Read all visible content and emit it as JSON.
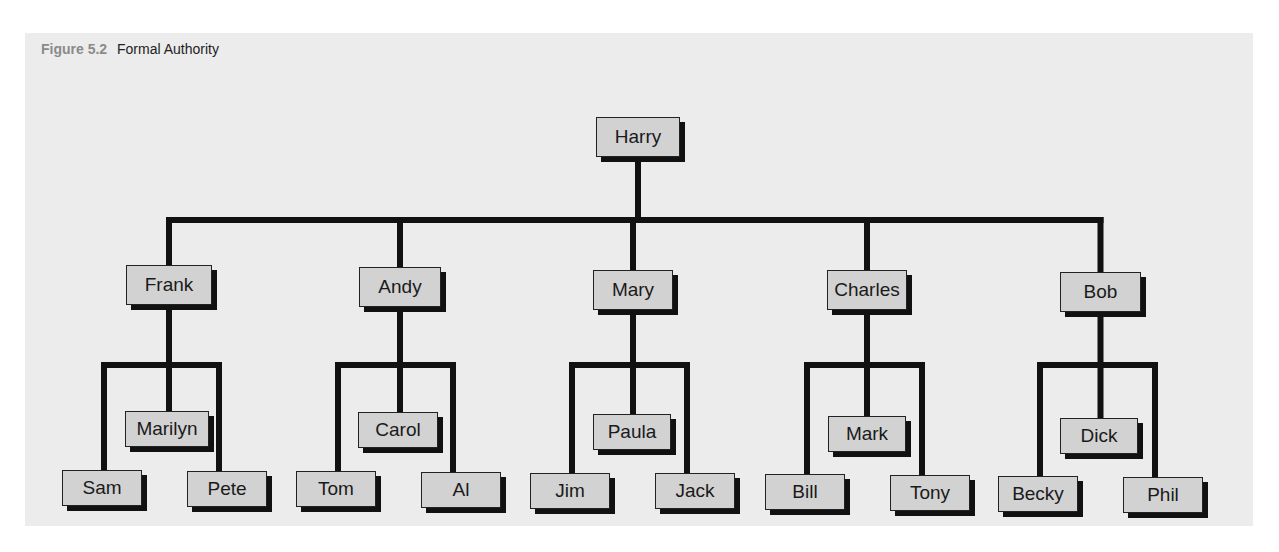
{
  "figure": {
    "label": "Figure 5.2",
    "title": "Formal Authority"
  },
  "colors": {
    "panel_background": "#ececec",
    "box_fill": "#d2d2d2",
    "line": "#111111",
    "figure_label": "#8a8a8a"
  },
  "org_chart": {
    "root": {
      "id": "harry",
      "name": "Harry",
      "x": 596,
      "y": 117,
      "w": 84,
      "h": 40,
      "children": [
        {
          "id": "frank",
          "name": "Frank",
          "x": 126,
          "y": 265,
          "w": 86,
          "h": 40,
          "children": [
            {
              "id": "sam",
              "name": "Sam",
              "x": 62,
              "y": 470,
              "w": 80,
              "h": 36
            },
            {
              "id": "marilyn",
              "name": "Marilyn",
              "x": 125,
              "y": 411,
              "w": 84,
              "h": 36
            },
            {
              "id": "pete",
              "name": "Pete",
              "x": 187,
              "y": 471,
              "w": 80,
              "h": 36
            }
          ]
        },
        {
          "id": "andy",
          "name": "Andy",
          "x": 359,
          "y": 267,
          "w": 82,
          "h": 40,
          "children": [
            {
              "id": "tom",
              "name": "Tom",
              "x": 296,
              "y": 471,
              "w": 80,
              "h": 36
            },
            {
              "id": "carol",
              "name": "Carol",
              "x": 358,
              "y": 412,
              "w": 80,
              "h": 36
            },
            {
              "id": "al",
              "name": "Al",
              "x": 421,
              "y": 472,
              "w": 80,
              "h": 36
            }
          ]
        },
        {
          "id": "mary",
          "name": "Mary",
          "x": 593,
          "y": 270,
          "w": 80,
          "h": 40,
          "children": [
            {
              "id": "jim",
              "name": "Jim",
              "x": 530,
              "y": 473,
              "w": 80,
              "h": 36
            },
            {
              "id": "paula",
              "name": "Paula",
              "x": 593,
              "y": 414,
              "w": 78,
              "h": 36
            },
            {
              "id": "jack",
              "name": "Jack",
              "x": 655,
              "y": 473,
              "w": 80,
              "h": 36
            }
          ]
        },
        {
          "id": "charles",
          "name": "Charles",
          "x": 827,
          "y": 270,
          "w": 80,
          "h": 40,
          "children": [
            {
              "id": "bill",
              "name": "Bill",
              "x": 765,
              "y": 474,
              "w": 80,
              "h": 36
            },
            {
              "id": "mark",
              "name": "Mark",
              "x": 828,
              "y": 416,
              "w": 78,
              "h": 36
            },
            {
              "id": "tony",
              "name": "Tony",
              "x": 890,
              "y": 475,
              "w": 80,
              "h": 36
            }
          ]
        },
        {
          "id": "bob",
          "name": "Bob",
          "x": 1060,
          "y": 272,
          "w": 81,
          "h": 40,
          "children": [
            {
              "id": "becky",
              "name": "Becky",
              "x": 998,
              "y": 476,
              "w": 80,
              "h": 36
            },
            {
              "id": "dick",
              "name": "Dick",
              "x": 1060,
              "y": 418,
              "w": 78,
              "h": 36
            },
            {
              "id": "phil",
              "name": "Phil",
              "x": 1123,
              "y": 477,
              "w": 80,
              "h": 36
            }
          ]
        }
      ]
    },
    "level1_bar_y": 220,
    "level2_bar_y": 365
  }
}
